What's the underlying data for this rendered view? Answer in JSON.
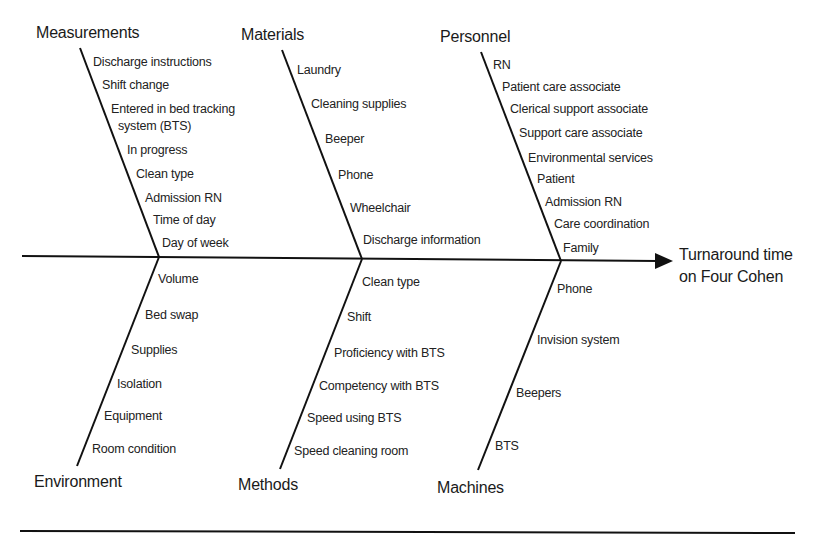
{
  "diagram": {
    "type": "fishbone",
    "effect": {
      "line1": "Turnaround time",
      "line2": "on Four Cohen"
    },
    "categories": {
      "measurements": {
        "label": "Measurements",
        "causes": [
          "Discharge instructions",
          "Shift change",
          "Entered in bed tracking",
          "system (BTS)",
          "In progress",
          "Clean type",
          "Admission RN",
          "Time of day",
          "Day of week"
        ]
      },
      "materials": {
        "label": "Materials",
        "causes": [
          "Laundry",
          "Cleaning supplies",
          "Beeper",
          "Phone",
          "Wheelchair",
          "Discharge information"
        ]
      },
      "personnel": {
        "label": "Personnel",
        "causes": [
          "RN",
          "Patient care associate",
          "Clerical support associate",
          "Support care associate",
          "Environmental services",
          "Patient",
          "Admission RN",
          "Care coordination",
          "Family"
        ]
      },
      "environment": {
        "label": "Environment",
        "causes": [
          "Volume",
          "Bed swap",
          "Supplies",
          "Isolation",
          "Equipment",
          "Room condition"
        ]
      },
      "methods": {
        "label": "Methods",
        "causes": [
          "Clean type",
          "Shift",
          "Proficiency with BTS",
          "Competency with BTS",
          "Speed using BTS",
          "Speed cleaning room"
        ]
      },
      "machines": {
        "label": "Machines",
        "causes": [
          "Phone",
          "Invision system",
          "Beepers",
          "BTS"
        ]
      }
    },
    "colors": {
      "line": "#111111",
      "text": "#1a1a1a",
      "background": "#ffffff"
    }
  }
}
